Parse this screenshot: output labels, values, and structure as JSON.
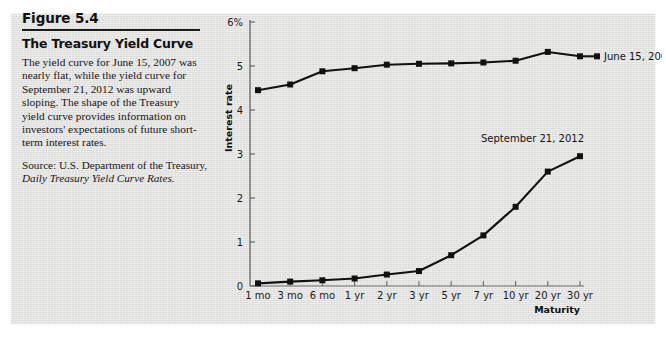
{
  "figure": {
    "number": "Figure 5.4",
    "title": "The Treasury Yield Curve",
    "body": "The yield curve for June 15, 2007 was nearly flat, while the yield curve for September 21, 2012 was upward sloping. The shape of the Treasury yield curve provides information on investors' expectations of future short-term interest rates.",
    "source_line1": "Source: U.S. Department of the Treasury,",
    "source_line2": "Daily Treasury Yield Curve Rates."
  },
  "colors": {
    "panel_background": "#e3e3e1",
    "line": "#111111",
    "marker": "#111111",
    "axis": "#6b6b6b",
    "text": "#17171a"
  },
  "chart_data": {
    "type": "line",
    "title": "The Treasury Yield Curve",
    "xlabel": "Maturity",
    "ylabel": "Interest rate",
    "categories": [
      "1 mo",
      "3 mo",
      "6 mo",
      "1 yr",
      "2 yr",
      "3 yr",
      "5 yr",
      "7 yr",
      "10 yr",
      "20 yr",
      "30 yr"
    ],
    "ylim": [
      0,
      6
    ],
    "yticks": [
      0,
      1,
      2,
      3,
      4,
      5,
      6
    ],
    "ytick_labels": [
      "0",
      "1",
      "2",
      "3",
      "4",
      "5",
      "6%"
    ],
    "grid": false,
    "legend_position": "inline-right-of-series",
    "series": [
      {
        "name": "June 15, 2007",
        "label": "June 15, 2007",
        "values": [
          4.45,
          4.58,
          4.88,
          4.95,
          5.03,
          5.05,
          5.06,
          5.08,
          5.12,
          5.32,
          5.22
        ]
      },
      {
        "name": "September 21, 2012",
        "label": "September 21, 2012",
        "values": [
          0.06,
          0.1,
          0.13,
          0.17,
          0.26,
          0.34,
          0.7,
          1.15,
          1.8,
          2.6,
          2.95
        ]
      }
    ]
  }
}
